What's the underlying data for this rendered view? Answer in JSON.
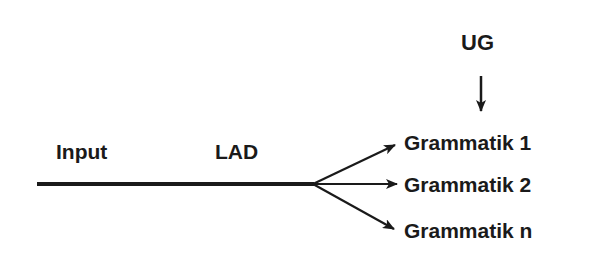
{
  "diagram": {
    "labels": {
      "ug": "UG",
      "input": "Input",
      "lad": "LAD"
    },
    "outputs": [
      {
        "label": "Grammatik 1"
      },
      {
        "label": "Grammatik 2"
      },
      {
        "label": "Grammatik n"
      }
    ],
    "colors": {
      "stroke": "#1a1a1a",
      "background": "#ffffff"
    }
  }
}
